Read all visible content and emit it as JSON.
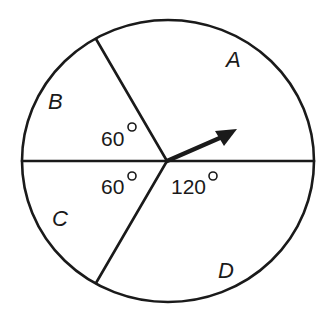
{
  "diagram": {
    "type": "spinner",
    "regions": [
      {
        "label": "A",
        "angle": null
      },
      {
        "label": "B",
        "angle": 60
      },
      {
        "label": "C",
        "angle": 60
      },
      {
        "label": "D",
        "angle": null
      }
    ],
    "labels": {
      "A": "A",
      "B": "B",
      "C": "C",
      "D": "D"
    },
    "angle_labels": {
      "upper_left": "60",
      "lower_left": "60",
      "lower_right": "120"
    },
    "pointer": "arrow",
    "colors": {
      "stroke": "#1a1a1a",
      "background": "#ffffff"
    }
  }
}
